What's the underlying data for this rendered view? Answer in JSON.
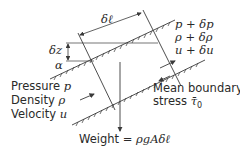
{
  "diagram": {
    "type": "fluid-element-free-body-diagram",
    "labels": {
      "delta_l": "δℓ",
      "delta_z": "δz",
      "alpha": "α",
      "right_pressure": "p + δp",
      "right_density": "ρ + δρ",
      "right_velocity": "u + δu",
      "left_pressure_prefix": "Pressure ",
      "left_pressure_symbol": "p",
      "left_density_prefix": "Density ",
      "left_density_symbol": "ρ",
      "left_velocity_prefix": "Velocity ",
      "left_velocity_symbol": "u",
      "stress_line1": "Mean boundary",
      "stress_line2_prefix": "stress ",
      "stress_symbol": "τ̄",
      "stress_subscript": "0",
      "weight_prefix": "Weight = ",
      "weight_formula": "ρgAδℓ"
    },
    "colors": {
      "line": "#3a3a3a",
      "text": "#2a2a2a",
      "background": "#ffffff"
    }
  }
}
